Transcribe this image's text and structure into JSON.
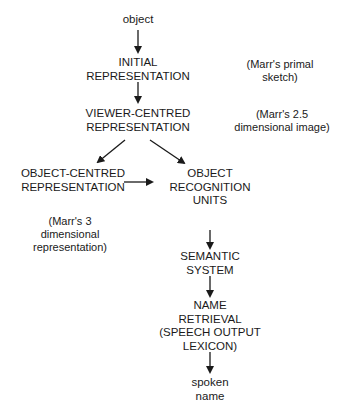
{
  "diagram": {
    "type": "flowchart",
    "nodes": {
      "object": "object",
      "initial": "INITIAL\nREPRESENTATION",
      "viewer": "VIEWER-CENTRED\nREPRESENTATION",
      "objcentred": "OBJECT-CENTRED\nREPRESENTATION",
      "oru": "OBJECT\nRECOGNITION\nUNITS",
      "semantic": "SEMANTIC\nSYSTEM",
      "name": "NAME\nRETRIEVAL\n(SPEECH OUTPUT\nLEXICON)",
      "spoken": "spoken\nname"
    },
    "notes": {
      "primal": "(Marr's primal\nsketch)",
      "twofive": "(Marr's 2.5\ndimensional image)",
      "three": "(Marr's 3\ndimensional\nrepresentation)"
    },
    "edges": [
      [
        "object",
        "initial"
      ],
      [
        "initial",
        "viewer"
      ],
      [
        "viewer",
        "objcentred"
      ],
      [
        "viewer",
        "oru"
      ],
      [
        "objcentred",
        "oru"
      ],
      [
        "oru",
        "semantic"
      ],
      [
        "semantic",
        "name"
      ],
      [
        "name",
        "spoken"
      ]
    ]
  }
}
